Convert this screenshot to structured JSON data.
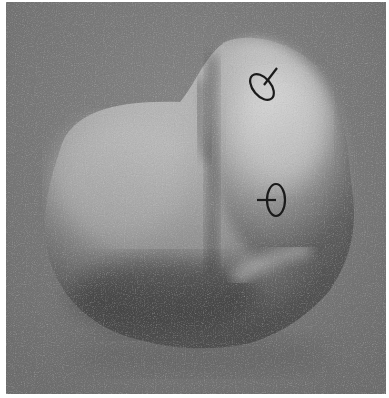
{
  "image": {
    "description": "Grayscale rendered smooth 3D blob shape on a gray noisy background with two gauge-figure (ellipse with stick) markers",
    "background_color": "#7d7d7d",
    "shape_highlight_color": "#d6d6d6",
    "shape_shadow_color": "#4a4a4a",
    "markers": [
      {
        "name": "upper-gauge",
        "cx": 262,
        "cy": 84,
        "rx": 10,
        "ry": 15,
        "rotation": -40,
        "stick": "upper-right"
      },
      {
        "name": "lower-gauge",
        "cx": 275,
        "cy": 200,
        "rx": 9,
        "ry": 16,
        "rotation": 0,
        "stick": "left"
      }
    ]
  }
}
